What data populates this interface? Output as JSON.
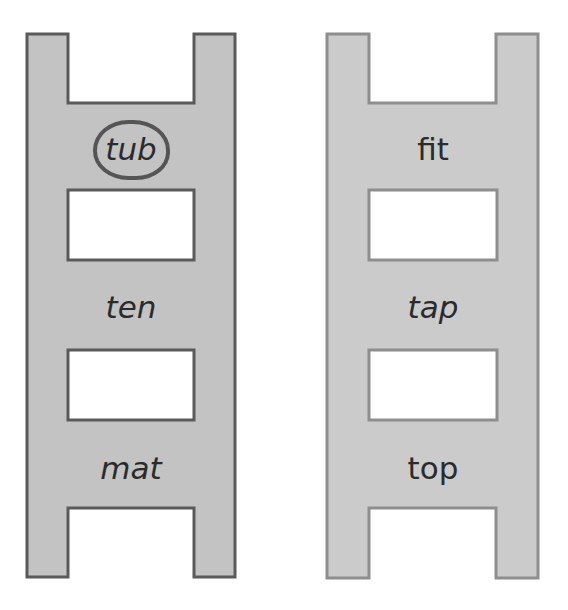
{
  "ladders": [
    {
      "id": "left",
      "fill": "#c3c3c3",
      "stroke": "#5a5a5a",
      "words": [
        {
          "text": "tub",
          "circled": true
        },
        {
          "text": "ten",
          "circled": false
        },
        {
          "text": "mat",
          "circled": false
        }
      ],
      "blank_boxes": 2
    },
    {
      "id": "right",
      "fill": "#cbcbcb",
      "stroke": "#8e8e8e",
      "words": [
        {
          "text": "fit",
          "circled": false
        },
        {
          "text": "tap",
          "circled": false
        },
        {
          "text": "top",
          "circled": false
        }
      ],
      "blank_boxes": 2
    }
  ]
}
